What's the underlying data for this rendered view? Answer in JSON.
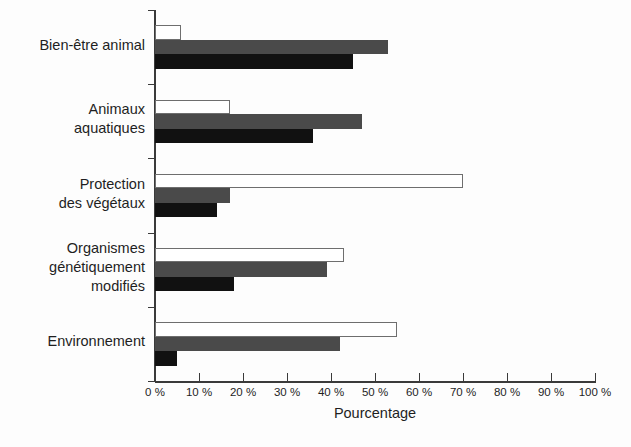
{
  "chart_data": {
    "type": "bar",
    "orientation": "horizontal",
    "title": "",
    "xlabel": "Pourcentage",
    "ylabel": "",
    "xlim": [
      0,
      100
    ],
    "grid": false,
    "legend": "none",
    "categories": [
      "Bien-être animal",
      "Animaux\naquatiques",
      "Protection\ndes végétaux",
      "Organismes\ngénétiquement\nmodifiés",
      "Environnement"
    ],
    "series": [
      {
        "name": "série 1",
        "style": "white",
        "values": [
          6,
          17,
          70,
          43,
          55
        ]
      },
      {
        "name": "série 2",
        "style": "gray",
        "values": [
          53,
          47,
          17,
          39,
          42
        ]
      },
      {
        "name": "série 3",
        "style": "black",
        "values": [
          45,
          36,
          14,
          18,
          5
        ]
      }
    ],
    "xticks": [
      0,
      10,
      20,
      30,
      40,
      50,
      60,
      70,
      80,
      90,
      100
    ],
    "xtick_labels": [
      "0 %",
      "10 %",
      "20 %",
      "30 %",
      "40 %",
      "50 %",
      "60 %",
      "70 %",
      "80 %",
      "90 %",
      "100 %"
    ],
    "colors": {
      "white_bar_fill": "#ffffff",
      "white_bar_stroke": "#6e6e6e",
      "gray_bar": "#4a4a4a",
      "black_bar": "#111111",
      "axis": "#3a3a3a",
      "text": "#1f1f1f",
      "background": "#fdfdfd"
    }
  },
  "axis": {
    "x_title": "Pourcentage"
  }
}
